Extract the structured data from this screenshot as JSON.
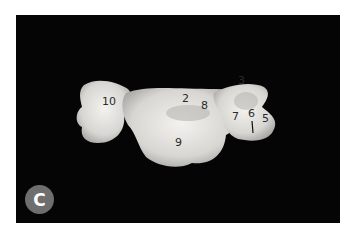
{
  "figure": {
    "panel_label": "C",
    "background_color": "#050505",
    "badge_color": "#6e6e6e",
    "labels": [
      {
        "id": "10",
        "text": "10"
      },
      {
        "id": "2",
        "text": "2"
      },
      {
        "id": "8",
        "text": "8"
      },
      {
        "id": "3",
        "text": "3"
      },
      {
        "id": "7",
        "text": "7"
      },
      {
        "id": "6",
        "text": "6"
      },
      {
        "id": "5",
        "text": "5"
      },
      {
        "id": "9",
        "text": "9"
      }
    ]
  }
}
